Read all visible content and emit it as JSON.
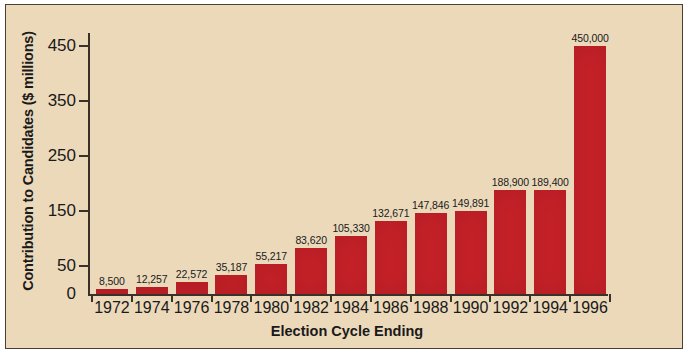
{
  "chart_data": {
    "type": "bar",
    "title": "",
    "xlabel": "Election Cycle Ending",
    "ylabel": "Contribution to Candidates ($ millions)",
    "categories": [
      "1972",
      "1974",
      "1976",
      "1978",
      "1980",
      "1982",
      "1984",
      "1986",
      "1988",
      "1990",
      "1992",
      "1994",
      "1996"
    ],
    "values": [
      8.5,
      12.257,
      22.572,
      35.187,
      55.217,
      83.62,
      105.33,
      132.671,
      147.846,
      149.891,
      188.9,
      189.4,
      450.0
    ],
    "data_labels": [
      "8,500",
      "12,257",
      "22,572",
      "35,187",
      "55,217",
      "83,620",
      "105,330",
      "132,671",
      "147,846",
      "149,891",
      "188,900",
      "189,400",
      "450,000"
    ],
    "ylim": [
      0,
      470
    ],
    "yticks": [
      0,
      50,
      150,
      250,
      350,
      450
    ],
    "ytick_labels": [
      "0",
      "50",
      "150",
      "250",
      "350",
      "450"
    ],
    "grid": false,
    "legend": "none",
    "bar_color": "#c62128",
    "background_color": "#ecd9ba",
    "axis_color": "#3a3128"
  }
}
